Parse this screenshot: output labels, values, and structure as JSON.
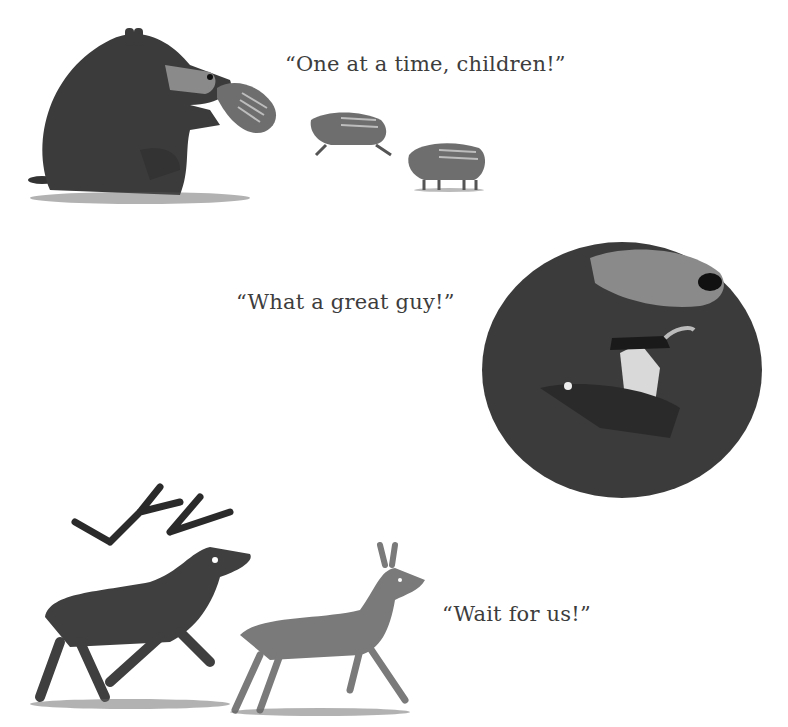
{
  "page": {
    "background": "#ffffff",
    "scenes": [
      {
        "name": "bear-with-piglets",
        "caption": "“One at a time, children!”",
        "characters": [
          "bear",
          "piglet",
          "piglet",
          "piglet"
        ]
      },
      {
        "name": "bear-hugging-man",
        "caption": "“What a great guy!”",
        "characters": [
          "bear",
          "man-in-hat"
        ]
      },
      {
        "name": "deer-running",
        "caption": "“Wait for us!”",
        "characters": [
          "stag",
          "doe"
        ]
      }
    ]
  },
  "colors": {
    "bear_fur": "#3b3b3b",
    "bear_muzzle": "#8a8a8a",
    "piglet": "#6e6e6e",
    "stag": "#3f3f3f",
    "doe": "#7a7a7a",
    "text": "#3d3d3d"
  }
}
